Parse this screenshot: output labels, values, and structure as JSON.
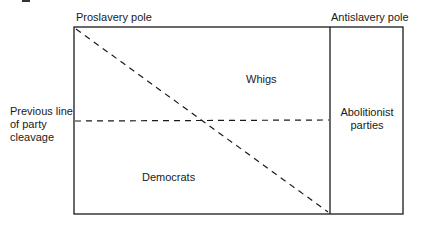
{
  "diagram": {
    "poles": {
      "left": "Proslavery pole",
      "right": "Antislavery pole"
    },
    "side_label": {
      "lines": [
        "Previous line",
        "of party",
        "cleavage"
      ]
    },
    "regions": {
      "upper": "Whigs",
      "lower": "Democrats",
      "right_box": [
        "Abolitionist",
        "parties"
      ]
    },
    "colors": {
      "line": "#1a1a1a",
      "background": "#ffffff"
    }
  }
}
